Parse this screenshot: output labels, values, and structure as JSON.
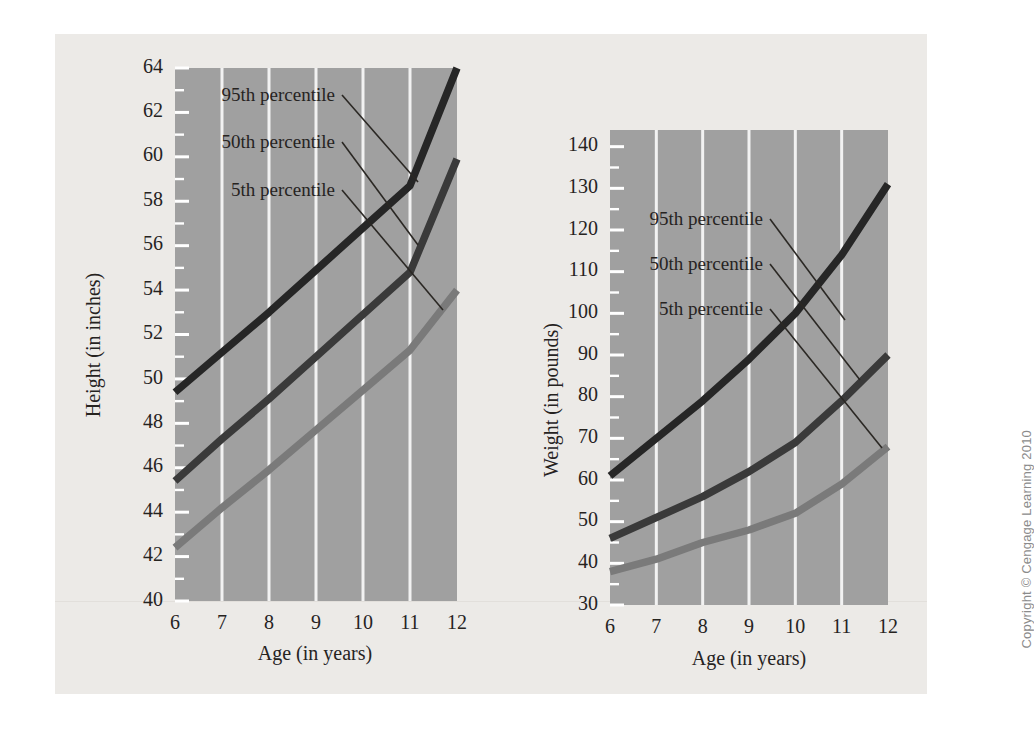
{
  "figure": {
    "copyright": "Copyright © Cengage Learning 2010",
    "background_color": "#eceae7",
    "plot_background_color": "#a0a0a0",
    "gridline_color": "#f2f2f2"
  },
  "series_colors": {
    "p95": "#262626",
    "p50": "#3a3a3a",
    "p5": "#7a7a7a"
  },
  "labels": {
    "p95": "95th percentile",
    "p50": "50th percentile",
    "p5": "5th percentile"
  },
  "chart_data": [
    {
      "type": "line",
      "title": "",
      "xlabel": "Age (in years)",
      "ylabel": "Height (in inches)",
      "x": [
        6,
        7,
        8,
        9,
        10,
        11,
        12
      ],
      "xtick_labels": [
        "6",
        "7",
        "8",
        "9",
        "10",
        "11",
        "12"
      ],
      "xlim": [
        6,
        12
      ],
      "ylim": [
        40,
        64
      ],
      "ytick_values": [
        40,
        42,
        44,
        46,
        48,
        50,
        52,
        54,
        56,
        58,
        60,
        62,
        64
      ],
      "ytick_labels": [
        "40",
        "42",
        "44",
        "46",
        "48",
        "50",
        "52",
        "54",
        "56",
        "58",
        "60",
        "62",
        "64"
      ],
      "yminor_step": 1,
      "grid": true,
      "legend": "inline-leader-lines",
      "series": [
        {
          "name": "95th percentile",
          "key": "p95",
          "values": [
            49.4,
            51.2,
            53.0,
            54.9,
            56.8,
            58.7,
            64.0
          ]
        },
        {
          "name": "50th percentile",
          "key": "p50",
          "values": [
            45.4,
            47.3,
            49.1,
            51.0,
            52.9,
            54.8,
            59.9
          ]
        },
        {
          "name": "5th percentile",
          "key": "p5",
          "values": [
            42.4,
            44.2,
            45.9,
            47.7,
            49.5,
            51.3,
            54.0
          ]
        }
      ]
    },
    {
      "type": "line",
      "title": "",
      "xlabel": "Age (in years)",
      "ylabel": "Weight (in pounds)",
      "x": [
        6,
        7,
        8,
        9,
        10,
        11,
        12
      ],
      "xtick_labels": [
        "6",
        "7",
        "8",
        "9",
        "10",
        "11",
        "12"
      ],
      "xlim": [
        6,
        12
      ],
      "ylim": [
        30,
        144
      ],
      "ytick_values": [
        30,
        40,
        50,
        60,
        70,
        80,
        90,
        100,
        110,
        120,
        130,
        140
      ],
      "ytick_labels": [
        "30",
        "40",
        "50",
        "60",
        "70",
        "80",
        "90",
        "100",
        "110",
        "120",
        "130",
        "140"
      ],
      "yminor_step": 5,
      "grid": true,
      "legend": "inline-leader-lines",
      "series": [
        {
          "name": "95th percentile",
          "key": "p95",
          "values": [
            61,
            70,
            79,
            89,
            100,
            114,
            131
          ]
        },
        {
          "name": "50th percentile",
          "key": "p50",
          "values": [
            46,
            51,
            56,
            62,
            69,
            79,
            90
          ]
        },
        {
          "name": "5th percentile",
          "key": "p5",
          "values": [
            38,
            41,
            45,
            48,
            52,
            59,
            68
          ]
        }
      ]
    }
  ]
}
